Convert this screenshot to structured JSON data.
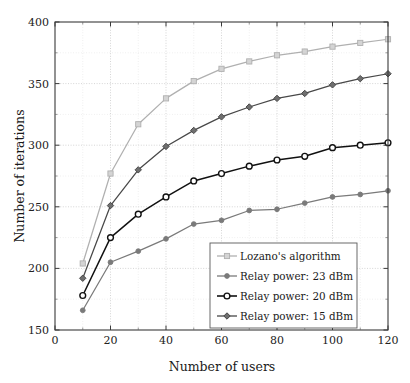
{
  "chart_data": {
    "type": "line",
    "title": "",
    "xlabel": "Number of users",
    "ylabel": "Number of iterations",
    "xlim": [
      0,
      120
    ],
    "ylim": [
      150,
      400
    ],
    "x_ticks": [
      0,
      20,
      40,
      60,
      80,
      100,
      120
    ],
    "y_ticks": [
      150,
      200,
      250,
      300,
      350,
      400
    ],
    "x_minor_step": 10,
    "y_minor_step": 25,
    "grid": true,
    "legend_position": "lower right",
    "x": [
      10,
      20,
      30,
      40,
      50,
      60,
      70,
      80,
      90,
      100,
      110,
      120
    ],
    "series": [
      {
        "name": "Lozano's algorithm",
        "marker": "square",
        "color": "#b0b0b0",
        "values": [
          204,
          277,
          317,
          338,
          352,
          362,
          368,
          373,
          376,
          380,
          383,
          386
        ]
      },
      {
        "name": "Relay power: 23 dBm",
        "marker": "filled-circle",
        "color": "#7a7a7a",
        "values": [
          166,
          205,
          214,
          224,
          236,
          239,
          247,
          248,
          253,
          258,
          260,
          263
        ]
      },
      {
        "name": "Relay power: 20 dBm",
        "marker": "open-circle",
        "color": "#111111",
        "values": [
          178,
          225,
          244,
          258,
          271,
          277,
          283,
          288,
          291,
          298,
          300,
          302
        ]
      },
      {
        "name": "Relay power: 15 dBm",
        "marker": "diamond",
        "color": "#484848",
        "values": [
          192,
          251,
          280,
          299,
          312,
          323,
          331,
          338,
          342,
          349,
          354,
          358
        ]
      }
    ]
  },
  "axes": {
    "x_tick_labels": [
      "0",
      "20",
      "40",
      "60",
      "80",
      "100",
      "120"
    ],
    "y_tick_labels": [
      "150",
      "200",
      "250",
      "300",
      "350",
      "400"
    ],
    "x_axis_title": "Number of users",
    "y_axis_title": "Number of iterations"
  },
  "legend": {
    "entries": [
      {
        "label": "Lozano's algorithm"
      },
      {
        "label": "Relay power: 23 dBm"
      },
      {
        "label": "Relay power: 20 dBm"
      },
      {
        "label": "Relay power: 15 dBm"
      }
    ]
  }
}
